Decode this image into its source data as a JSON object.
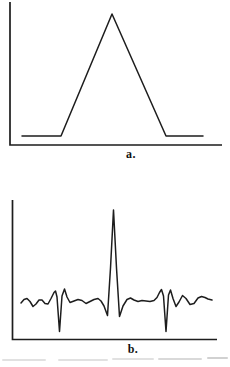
{
  "page": {
    "width": 230,
    "height": 367,
    "background": "#ffffff"
  },
  "colors": {
    "ink": "#1d1d1d",
    "caption_ink": "#111111",
    "remnant_gray": "#9a9a9a"
  },
  "chart_data": [
    {
      "type": "line",
      "panel": "a",
      "caption": "a.",
      "title": "",
      "xlabel": "",
      "ylabel": "",
      "axes": {
        "frame_style": "left-and-bottom L frame",
        "x_ticks": [],
        "y_ticks": [],
        "grid": false,
        "legend": "none"
      },
      "series": [
        {
          "name": "triangular pulse",
          "normalized_points": [
            [
              0.06,
              0
            ],
            [
              0.24,
              0
            ],
            [
              0.48,
              1
            ],
            [
              0.74,
              0
            ],
            [
              0.91,
              0
            ]
          ]
        }
      ],
      "px": {
        "frame": [
          [
            10,
            2
          ],
          [
            10,
            145
          ],
          [
            222,
            145
          ]
        ],
        "curve": [
          [
            22,
            136
          ],
          [
            61,
            136
          ],
          [
            112,
            14
          ],
          [
            166,
            136
          ],
          [
            203,
            136
          ]
        ]
      }
    },
    {
      "type": "line",
      "panel": "b",
      "caption": "b.",
      "title": "",
      "xlabel": "",
      "ylabel": "",
      "axes": {
        "frame_style": "left-and-bottom L frame",
        "x_ticks": [],
        "y_ticks": [],
        "grid": false,
        "legend": "none"
      },
      "series": [
        {
          "name": "noisy trace with tall central peak and two negative spikes",
          "feature_summary": {
            "central_peak_x_fraction": 0.49,
            "negative_spike_x_fractions": [
              0.24,
              0.75
            ],
            "baseline_level": 0,
            "central_peak_relative_height": 1,
            "negative_spike_relative_depth": -0.33
          }
        }
      ],
      "px": {
        "frame": [
          [
            12.5,
            200
          ],
          [
            12.5,
            339.5
          ],
          [
            217,
            339.5
          ]
        ],
        "curve": [
          [
            21,
            303
          ],
          [
            24,
            299.5
          ],
          [
            27,
            298.5
          ],
          [
            30,
            301.5
          ],
          [
            33,
            306.5
          ],
          [
            36,
            304
          ],
          [
            39,
            300
          ],
          [
            42,
            300
          ],
          [
            45,
            303.5
          ],
          [
            48,
            304
          ],
          [
            51,
            298.5
          ],
          [
            54,
            292.5
          ],
          [
            55.5,
            291
          ],
          [
            57,
            297
          ],
          [
            59.5,
            331.5
          ],
          [
            62,
            296
          ],
          [
            64.5,
            289
          ],
          [
            67,
            297
          ],
          [
            70,
            302.5
          ],
          [
            74,
            301
          ],
          [
            78,
            299.5
          ],
          [
            82,
            300.5
          ],
          [
            86,
            303.5
          ],
          [
            90,
            301.5
          ],
          [
            94,
            299.5
          ],
          [
            98,
            298.5
          ],
          [
            101,
            301
          ],
          [
            104,
            306
          ],
          [
            107.5,
            315.5
          ],
          [
            110.5,
            268
          ],
          [
            113.5,
            210
          ],
          [
            116.5,
            268
          ],
          [
            119.5,
            316.5
          ],
          [
            123,
            306
          ],
          [
            127,
            299.5
          ],
          [
            130.5,
            298
          ],
          [
            134,
            300
          ],
          [
            138,
            301.5
          ],
          [
            142,
            300.5
          ],
          [
            146,
            301
          ],
          [
            150,
            301.5
          ],
          [
            154,
            300.5
          ],
          [
            157,
            297.5
          ],
          [
            159.5,
            292.5
          ],
          [
            161.5,
            289.5
          ],
          [
            163.5,
            296
          ],
          [
            166,
            331.5
          ],
          [
            168.5,
            295
          ],
          [
            170.5,
            290
          ],
          [
            173,
            298.5
          ],
          [
            176,
            306.5
          ],
          [
            179,
            302
          ],
          [
            182.5,
            295.5
          ],
          [
            186,
            298.5
          ],
          [
            190,
            304.5
          ],
          [
            194,
            303.5
          ],
          [
            198,
            298
          ],
          [
            201.5,
            296.5
          ],
          [
            205,
            297.5
          ],
          [
            208,
            299
          ],
          [
            212,
            300
          ]
        ]
      }
    }
  ],
  "footer": {
    "remnant_note": "faint cut-off line of print at bottom edge, illegible"
  }
}
